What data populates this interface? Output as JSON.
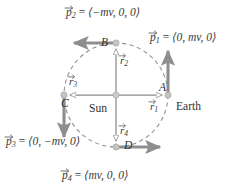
{
  "figure": {
    "center_body": "Sun",
    "orbiting_body": "Earth",
    "orbit_style": "dashed-circle",
    "colors": {
      "orbit": "#8c8c8c",
      "axis_line": "#8a8a8a",
      "momentum_arrow": "#8e8e8e",
      "radius_arrow_outline": "#8a8a8a",
      "radius_arrow_fill": "#ffffff",
      "node_dot": "#b9b9b9",
      "text": "#3a3a3a"
    }
  },
  "center_label": "Sun",
  "earth_label": "Earth",
  "points": [
    {
      "id": "A",
      "label": "A",
      "position": "right"
    },
    {
      "id": "B",
      "label": "B",
      "position": "top"
    },
    {
      "id": "C",
      "label": "C",
      "position": "left"
    },
    {
      "id": "D",
      "label": "D",
      "position": "bottom"
    }
  ],
  "radius_vectors": [
    {
      "id": "r1",
      "symbol": "r",
      "subscript": "1",
      "direction": "right"
    },
    {
      "id": "r2",
      "symbol": "r",
      "subscript": "2",
      "direction": "up"
    },
    {
      "id": "r3",
      "symbol": "r",
      "subscript": "3",
      "direction": "left"
    },
    {
      "id": "r4",
      "symbol": "r",
      "subscript": "4",
      "direction": "down"
    }
  ],
  "momentum_vectors": [
    {
      "id": "p1",
      "symbol": "p",
      "subscript": "1",
      "equals": "=",
      "components": "⟨0, mv, 0⟩",
      "at_point": "A",
      "direction": "up"
    },
    {
      "id": "p2",
      "symbol": "p",
      "subscript": "2",
      "equals": "=",
      "components": "⟨−mv, 0, 0⟩",
      "at_point": "B",
      "direction": "left"
    },
    {
      "id": "p3",
      "symbol": "p",
      "subscript": "3",
      "equals": "=",
      "components": "⟨0, −mv, 0⟩",
      "at_point": "C",
      "direction": "down"
    },
    {
      "id": "p4",
      "symbol": "p",
      "subscript": "4",
      "equals": "=",
      "components": "⟨mv, 0, 0⟩",
      "at_point": "D",
      "direction": "right"
    }
  ]
}
